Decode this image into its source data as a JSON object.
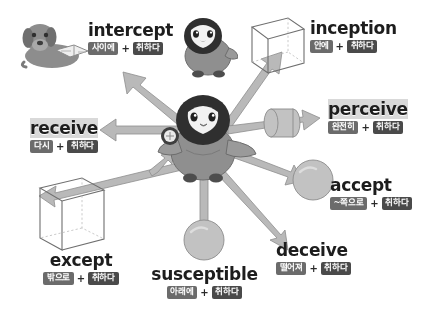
{
  "diagram": {
    "root_meaning": "취하다",
    "center_character": "penguin-holding-coin",
    "colors": {
      "chip_light": "#6b6b6b",
      "chip_dark": "#4a4a4a",
      "arrow": "#b9b9b9",
      "text": "#1d1d1d",
      "background": "#ffffff"
    }
  },
  "words": [
    {
      "id": "intercept",
      "word": "intercept",
      "prefix_gloss": "사이에",
      "root_gloss": "취하다",
      "plus": "+",
      "icon": "dog-reading-book"
    },
    {
      "id": "inception",
      "word": "inception",
      "prefix_gloss": "안에",
      "root_gloss": "취하다",
      "plus": "+",
      "icon": "arrow-into-cube"
    },
    {
      "id": "perceive",
      "word": "perceive",
      "prefix_gloss": "완전히",
      "root_gloss": "취하다",
      "plus": "+",
      "icon": "arrow-through-cylinder"
    },
    {
      "id": "accept",
      "word": "accept",
      "prefix_gloss": "~쪽으로",
      "root_gloss": "취하다",
      "plus": "+",
      "icon": "arrow-toward-sphere"
    },
    {
      "id": "deceive",
      "word": "deceive",
      "prefix_gloss": "떨어져",
      "root_gloss": "취하다",
      "plus": "+",
      "icon": "arrow-away-down"
    },
    {
      "id": "susceptible",
      "word": "susceptible",
      "prefix_gloss": "아래에",
      "root_gloss": "취하다",
      "plus": "+",
      "icon": "arrow-down-into-sphere"
    },
    {
      "id": "except",
      "word": "except",
      "prefix_gloss": "밖으로",
      "root_gloss": "취하다",
      "plus": "+",
      "icon": "arrow-out-of-cube"
    },
    {
      "id": "receive",
      "word": "receive",
      "prefix_gloss": "다시",
      "root_gloss": "취하다",
      "plus": "+",
      "icon": "arrow-back-left"
    }
  ]
}
